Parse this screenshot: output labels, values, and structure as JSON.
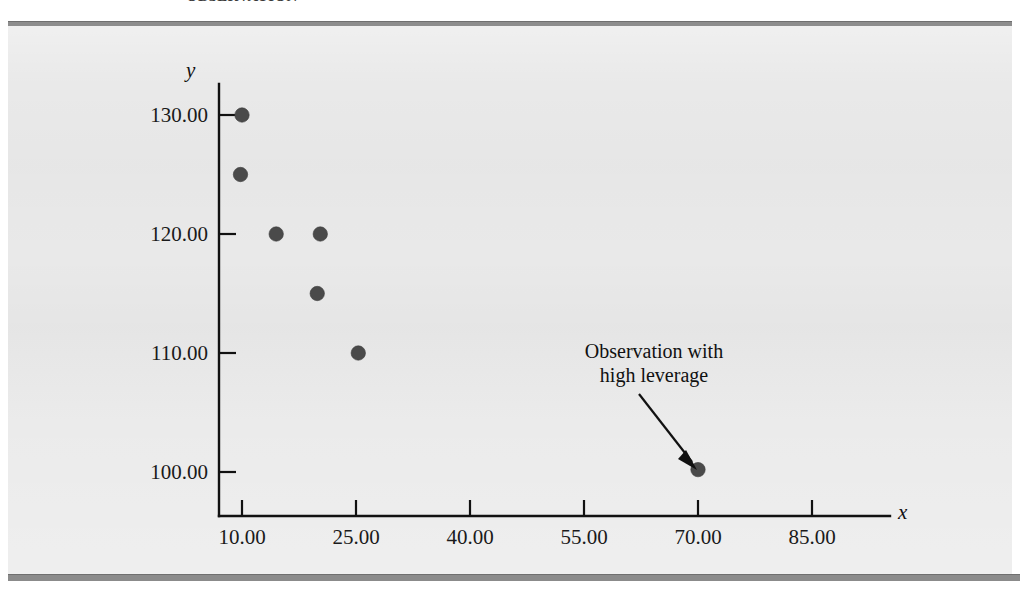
{
  "figure": {
    "caption": "OBSERVATION",
    "background_color": "#e9e9e9",
    "rule_color": "#8b8b8b"
  },
  "chart_data": {
    "type": "scatter",
    "title": "",
    "xlabel": "x",
    "ylabel": "y",
    "xlim": [
      5,
      92
    ],
    "ylim": [
      96,
      133
    ],
    "grid": false,
    "legend": "none",
    "xticks": [
      "10.00",
      "25.00",
      "40.00",
      "55.00",
      "70.00",
      "85.00"
    ],
    "xtick_values": [
      10,
      25,
      40,
      55,
      70,
      85
    ],
    "yticks": [
      "100.00",
      "110.00",
      "120.00",
      "130.00"
    ],
    "ytick_values": [
      100,
      110,
      120,
      130
    ],
    "points": [
      {
        "x": 10.0,
        "y": 130.0
      },
      {
        "x": 9.8,
        "y": 125.0
      },
      {
        "x": 14.5,
        "y": 120.0
      },
      {
        "x": 20.3,
        "y": 120.0
      },
      {
        "x": 19.9,
        "y": 115.0
      },
      {
        "x": 25.3,
        "y": 110.0
      },
      {
        "x": 70.0,
        "y": 100.2
      }
    ],
    "marker_color": "#4a4a4a",
    "annotations": [
      {
        "text_line_1": "Observation with",
        "text_line_2": "high leverage",
        "points_to": {
          "x": 70.0,
          "y": 100.2
        }
      }
    ]
  }
}
